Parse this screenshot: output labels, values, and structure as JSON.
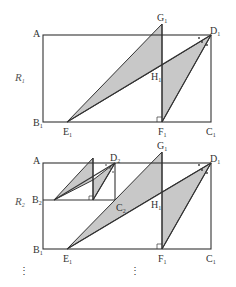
{
  "figure": {
    "type": "geometry",
    "top": {
      "region_label": "R",
      "region_sub": "1",
      "points": {
        "A": "A",
        "B1": {
          "main": "B",
          "sub": "1"
        },
        "C1": {
          "main": "C",
          "sub": "1"
        },
        "D1": {
          "main": "D",
          "sub": "1"
        },
        "E1": {
          "main": "E",
          "sub": "1"
        },
        "F1": {
          "main": "F",
          "sub": "1"
        },
        "G1": {
          "main": "G",
          "sub": "1"
        },
        "H1": {
          "main": "H",
          "sub": "1"
        }
      }
    },
    "bottom": {
      "region_label": "R",
      "region_sub": "2",
      "points": {
        "A": "A",
        "B1": {
          "main": "B",
          "sub": "1"
        },
        "B2": {
          "main": "B",
          "sub": "2"
        },
        "C1": {
          "main": "C",
          "sub": "1"
        },
        "C2": {
          "main": "C",
          "sub": "2"
        },
        "D1": {
          "main": "D",
          "sub": "1"
        },
        "D2": {
          "main": "D",
          "sub": "2"
        },
        "E1": {
          "main": "E",
          "sub": "1"
        },
        "F1": {
          "main": "F",
          "sub": "1"
        },
        "G1": {
          "main": "G",
          "sub": "1"
        },
        "H1": {
          "main": "H",
          "sub": "1"
        }
      }
    },
    "continuation": "⋮",
    "colors": {
      "shade": "#c8c8c8",
      "line": "#333333"
    }
  }
}
